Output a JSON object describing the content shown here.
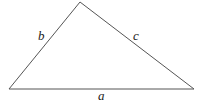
{
  "diagram": {
    "type": "triangle",
    "vertices": {
      "left": [
        9,
        89
      ],
      "top": [
        80,
        2
      ],
      "right": [
        194,
        89
      ]
    },
    "sides": [
      {
        "name": "a",
        "label": "a",
        "from": "left",
        "to": "right"
      },
      {
        "name": "b",
        "label": "b",
        "from": "left",
        "to": "top"
      },
      {
        "name": "c",
        "label": "c",
        "from": "top",
        "to": "right"
      }
    ],
    "stroke_color": "#555555"
  }
}
